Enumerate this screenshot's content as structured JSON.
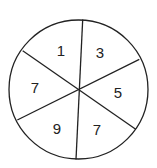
{
  "diagram": {
    "type": "spinner",
    "sectors": [
      {
        "label": "1",
        "position": "top-left"
      },
      {
        "label": "3",
        "position": "top-right"
      },
      {
        "label": "5",
        "position": "right"
      },
      {
        "label": "7",
        "position": "bottom-right"
      },
      {
        "label": "9",
        "position": "bottom-left"
      },
      {
        "label": "7",
        "position": "left"
      }
    ],
    "stroke_color": "#222222",
    "fill_color": "#ffffff"
  }
}
